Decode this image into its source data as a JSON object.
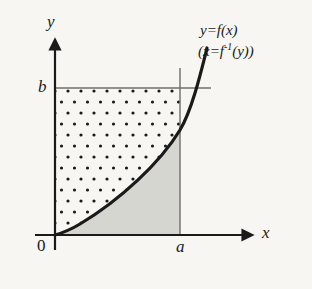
{
  "figure": {
    "kind": "calculus-diagram-young-inequality",
    "background_color": "#f7f6f2",
    "ink_color": "#1a1a1a",
    "shaded_region_color": "#d6d6d1",
    "thin_line_color": "#6e6e6a",
    "width": 312,
    "height": 289
  },
  "axes": {
    "x_label": "x",
    "y_label": "y",
    "origin_label": "0",
    "x_axis_y": 235,
    "y_axis_x": 55,
    "x_axis_start": 35,
    "x_axis_end": 258,
    "y_axis_top": 36,
    "y_axis_bottom": 250,
    "arrowheads": true
  },
  "ticks": {
    "x_value_label": "a",
    "y_value_label": "b",
    "a_x": 180,
    "b_y": 88
  },
  "guides": {
    "vertical_line_at_a": {
      "x": 180,
      "y_top": 68,
      "y_bottom": 235
    },
    "horizontal_line_at_b": {
      "y": 88,
      "x_left": 55,
      "x_right": 211
    }
  },
  "curve": {
    "label_primary": "y=f(x)",
    "label_secondary": "(x=f",
    "label_secondary_exponent": "-1",
    "label_secondary_tail": "(y))",
    "start": [
      55,
      235
    ],
    "end": [
      207,
      48
    ],
    "shape": "increasing concave-up power curve through origin",
    "stroke_width": 3.2
  },
  "regions": {
    "dotted_region": {
      "name": "region-above-curve",
      "fill": "dot-pattern",
      "dot_color": "#1a1a1a",
      "dot_radius": 1.5,
      "dot_spacing_x": 13,
      "dot_spacing_y": 11,
      "staggered": true
    },
    "gray_region": {
      "name": "region-below-curve",
      "fill": "#d6d6d1"
    }
  }
}
